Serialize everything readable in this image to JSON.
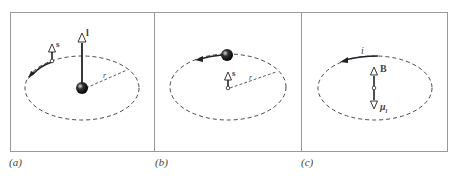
{
  "panels": [
    {
      "id": "a",
      "caption": "(a)",
      "vectors": {
        "orbital": "l",
        "spin": "s"
      },
      "radius_label": "r"
    },
    {
      "id": "b",
      "caption": "(b)",
      "vectors": {
        "spin": "s"
      },
      "radius_label": "r"
    },
    {
      "id": "c",
      "caption": "(c)",
      "vectors": {
        "field": "B",
        "moment": "μ",
        "moment_sub": "l"
      },
      "current_label": "i"
    }
  ],
  "colors": {
    "frame": "#999999",
    "ink": "#222222"
  }
}
